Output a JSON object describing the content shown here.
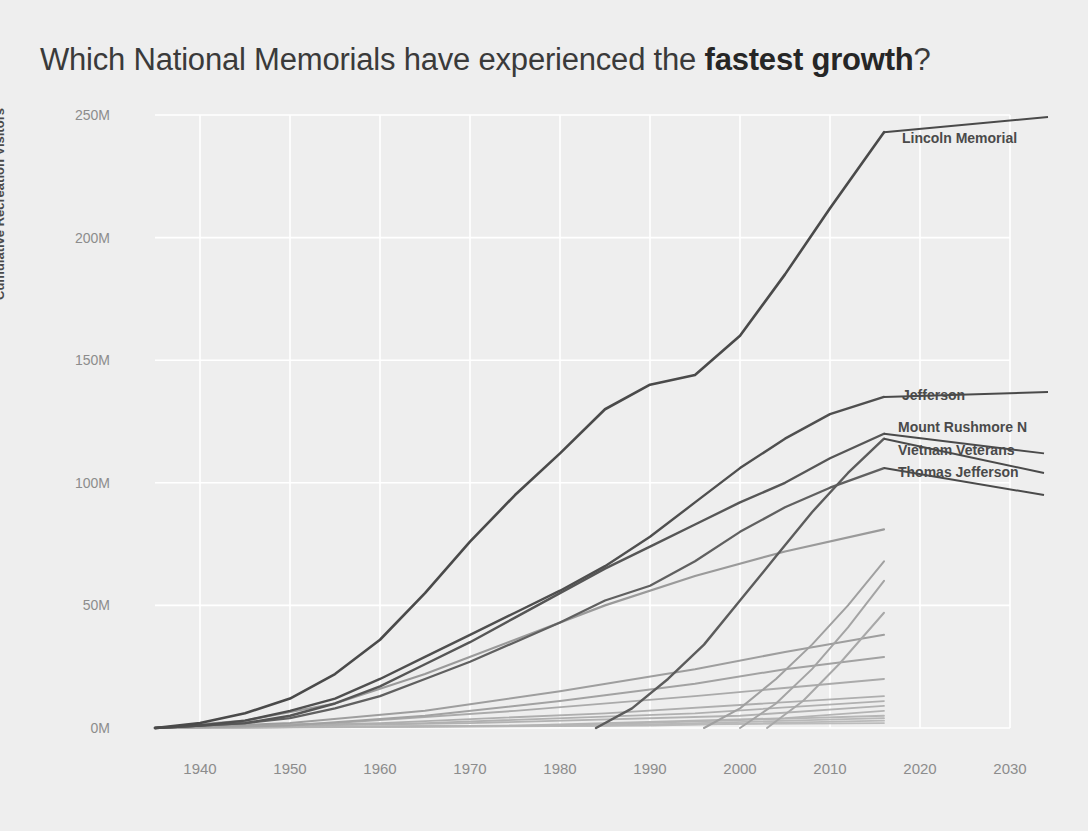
{
  "title": {
    "prefix": "Which National Memorials have experienced the ",
    "emphasis": "fastest growth",
    "suffix": "?"
  },
  "axes": {
    "ylabel": "Cumulative Recreation Visitors",
    "yticks": [
      "0M",
      "50M",
      "100M",
      "150M",
      "200M",
      "250M"
    ],
    "xticks": [
      "1940",
      "1950",
      "1960",
      "1970",
      "1980",
      "1990",
      "2000",
      "2010",
      "2020",
      "2030"
    ]
  },
  "colors": {
    "background": "#eeeeee",
    "gridline": "#ffffff",
    "line_dark": "#4a4a4a",
    "line_mid": "#6e6e6e",
    "line_light": "#9a9a9a",
    "line_faint": "#b4b4b4",
    "text": "#3a3a3a",
    "tick_text": "#8c8c8c"
  },
  "annotations": [
    {
      "label": "Lincoln Memorial",
      "x": 902,
      "y": 130
    },
    {
      "label": "Jefferson",
      "x": 902,
      "y": 387
    },
    {
      "label": "Mount Rushmore N",
      "x": 898,
      "y": 419
    },
    {
      "label": "Vietnam Veterans",
      "x": 898,
      "y": 442
    },
    {
      "label": "Thomas Jefferson",
      "x": 898,
      "y": 464
    }
  ],
  "chart_data": {
    "type": "line",
    "title": "Which National Memorials have experienced the fastest growth?",
    "xlabel": "",
    "ylabel": "Cumulative Recreation Visitors",
    "xlim": [
      1935,
      2030
    ],
    "ylim": [
      0,
      250
    ],
    "y_unit": "millions of visitors",
    "grid": true,
    "legend": "inline-right-labels",
    "series": [
      {
        "name": "Lincoln Memorial",
        "color": "#4a4a4a",
        "width": 2.6,
        "x": [
          1935,
          1940,
          1945,
          1950,
          1955,
          1960,
          1965,
          1970,
          1975,
          1980,
          1985,
          1990,
          1995,
          2000,
          2005,
          2010,
          2016
        ],
        "values": [
          0,
          2,
          6,
          12,
          22,
          36,
          55,
          76,
          95,
          112,
          130,
          140,
          144,
          160,
          185,
          212,
          243
        ]
      },
      {
        "name": "Jefferson",
        "color": "#4f4f4f",
        "width": 2.4,
        "x": [
          1935,
          1940,
          1945,
          1950,
          1955,
          1960,
          1965,
          1970,
          1975,
          1980,
          1985,
          1990,
          1995,
          2000,
          2005,
          2010,
          2016
        ],
        "values": [
          0,
          1,
          3,
          7,
          12,
          20,
          29,
          38,
          47,
          56,
          66,
          78,
          92,
          106,
          118,
          128,
          135
        ]
      },
      {
        "name": "Mount Rushmore N",
        "color": "#565656",
        "width": 2.4,
        "x": [
          1935,
          1940,
          1945,
          1950,
          1955,
          1960,
          1965,
          1970,
          1975,
          1980,
          1985,
          1990,
          1995,
          2000,
          2005,
          2010,
          2016
        ],
        "values": [
          0,
          1,
          2,
          5,
          10,
          17,
          26,
          35,
          45,
          55,
          65,
          74,
          83,
          92,
          100,
          110,
          120
        ]
      },
      {
        "name": "Vietnam Veterans",
        "color": "#5c5c5c",
        "width": 2.4,
        "x": [
          1984,
          1988,
          1992,
          1996,
          2000,
          2004,
          2008,
          2012,
          2016
        ],
        "values": [
          0,
          8,
          20,
          34,
          52,
          70,
          88,
          104,
          118
        ]
      },
      {
        "name": "Thomas Jefferson",
        "color": "#606060",
        "width": 2.3,
        "x": [
          1935,
          1940,
          1945,
          1950,
          1955,
          1960,
          1965,
          1970,
          1975,
          1980,
          1985,
          1990,
          1995,
          2000,
          2005,
          2010,
          2016
        ],
        "values": [
          0,
          1,
          2,
          4,
          8,
          13,
          20,
          27,
          35,
          43,
          52,
          58,
          68,
          80,
          90,
          98,
          106
        ]
      },
      {
        "name": "series-6",
        "color": "#9a9a9a",
        "width": 2.2,
        "x": [
          1935,
          1945,
          1955,
          1965,
          1975,
          1985,
          1995,
          2005,
          2016
        ],
        "values": [
          0,
          3,
          10,
          22,
          36,
          50,
          62,
          72,
          81
        ]
      },
      {
        "name": "series-7",
        "color": "#a0a0a0",
        "width": 2.0,
        "x": [
          1996,
          2000,
          2004,
          2008,
          2012,
          2016
        ],
        "values": [
          0,
          8,
          20,
          34,
          50,
          68
        ]
      },
      {
        "name": "series-8",
        "color": "#a4a4a4",
        "width": 2.0,
        "x": [
          2000,
          2004,
          2008,
          2012,
          2016
        ],
        "values": [
          0,
          10,
          24,
          41,
          60
        ]
      },
      {
        "name": "series-9",
        "color": "#a8a8a8",
        "width": 2.0,
        "x": [
          2003,
          2007,
          2011,
          2016
        ],
        "values": [
          0,
          11,
          26,
          47
        ]
      },
      {
        "name": "series-10",
        "color": "#9e9e9e",
        "width": 2.0,
        "x": [
          1935,
          1950,
          1965,
          1980,
          1995,
          2005,
          2016
        ],
        "values": [
          0,
          2,
          7,
          15,
          24,
          31,
          38
        ]
      },
      {
        "name": "series-11",
        "color": "#a2a2a2",
        "width": 2.0,
        "x": [
          1935,
          1950,
          1965,
          1980,
          1995,
          2005,
          2016
        ],
        "values": [
          0,
          1,
          5,
          11,
          18,
          24,
          29
        ]
      },
      {
        "name": "series-12",
        "color": "#aaaaaa",
        "width": 1.9,
        "x": [
          1935,
          1955,
          1975,
          1995,
          2016
        ],
        "values": [
          0,
          2,
          7,
          13,
          20
        ]
      },
      {
        "name": "series-13",
        "color": "#aeaeae",
        "width": 1.8,
        "x": [
          1935,
          1960,
          1985,
          2016
        ],
        "values": [
          0,
          2,
          6,
          13
        ]
      },
      {
        "name": "series-14",
        "color": "#b0b0b0",
        "width": 1.8,
        "x": [
          1935,
          1965,
          1995,
          2016
        ],
        "values": [
          0,
          2,
          6,
          11
        ]
      },
      {
        "name": "series-15",
        "color": "#b2b2b2",
        "width": 1.8,
        "x": [
          1935,
          1970,
          2000,
          2016
        ],
        "values": [
          0,
          2,
          5,
          9
        ]
      },
      {
        "name": "series-16",
        "color": "#b4b4b4",
        "width": 1.8,
        "x": [
          1935,
          1975,
          2005,
          2016
        ],
        "values": [
          0,
          1,
          4,
          7
        ]
      },
      {
        "name": "series-17",
        "color": "#b6b6b6",
        "width": 1.8,
        "x": [
          1935,
          1980,
          2016
        ],
        "values": [
          0,
          1,
          5
        ]
      },
      {
        "name": "series-18",
        "color": "#b8b8b8",
        "width": 1.8,
        "x": [
          1935,
          1985,
          2016
        ],
        "values": [
          0,
          1,
          4
        ]
      },
      {
        "name": "series-19",
        "color": "#bababa",
        "width": 1.8,
        "x": [
          1935,
          1990,
          2016
        ],
        "values": [
          0,
          1,
          3
        ]
      },
      {
        "name": "series-20",
        "color": "#bcbcbc",
        "width": 1.8,
        "x": [
          1935,
          2016
        ],
        "values": [
          0,
          2
        ]
      }
    ]
  }
}
